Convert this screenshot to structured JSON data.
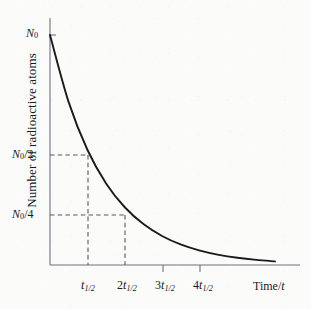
{
  "chart_data": {
    "type": "line",
    "title": "",
    "subtitle": "",
    "xlabel": "Time/t",
    "ylabel": "Number of radioactive atoms",
    "curve_label": "radioactive decay curve",
    "function": "N = N0 * 2^(-t / t_half)",
    "x": [
      0,
      0.5,
      1,
      1.5,
      2,
      2.5,
      3,
      3.5,
      4,
      4.5,
      5,
      5.5,
      6
    ],
    "y": [
      1,
      0.7071,
      0.5,
      0.3536,
      0.25,
      0.1768,
      0.125,
      0.0884,
      0.0625,
      0.0442,
      0.03125,
      0.0221,
      0.0156
    ],
    "x_unit": "half-lives",
    "y_unit": "fraction of N0",
    "xlim": [
      0,
      6
    ],
    "ylim": [
      0,
      1
    ],
    "grid": false,
    "legend": false,
    "x_ticks": [
      {
        "value": 1,
        "label_main": "t",
        "label_sub": "1/2",
        "prefix": ""
      },
      {
        "value": 2,
        "label_main": "t",
        "label_sub": "1/2",
        "prefix": "2"
      },
      {
        "value": 3,
        "label_main": "t",
        "label_sub": "1/2",
        "prefix": "3"
      },
      {
        "value": 4,
        "label_main": "t",
        "label_sub": "1/2",
        "prefix": "4"
      }
    ],
    "y_ticks": [
      {
        "value": 1,
        "label_main": "N",
        "label_sub": "0",
        "suffix": ""
      },
      {
        "value": 0.5,
        "label_main": "N",
        "label_sub": "0",
        "suffix": "/2"
      },
      {
        "value": 0.25,
        "label_main": "N",
        "label_sub": "0",
        "suffix": "/4"
      }
    ],
    "annotations": [
      {
        "name": "half-life-1-guide",
        "type": "dashed-guide",
        "from_y": 0.5,
        "to_x": 1
      },
      {
        "name": "half-life-2-guide",
        "type": "dashed-guide",
        "from_y": 0.25,
        "to_x": 2
      }
    ]
  },
  "axes": {
    "y_title": "Number of radioactive atoms",
    "x_title_prefix": "Time/",
    "x_title_var": "t"
  },
  "labels": {
    "n0": "N",
    "n0_sub": "0",
    "n0_half": "N",
    "n0_half_sub": "0",
    "n0_half_suffix": "/2",
    "n0_quarter": "N",
    "n0_quarter_sub": "0",
    "n0_quarter_suffix": "/4",
    "t_half_1_prefix": "",
    "t_half_1_var": "t",
    "t_half_1_sub": "1/2",
    "t_half_2_prefix": "2",
    "t_half_2_var": "t",
    "t_half_2_sub": "1/2",
    "t_half_3_prefix": "3",
    "t_half_3_var": "t",
    "t_half_3_sub": "1/2",
    "t_half_4_prefix": "4",
    "t_half_4_var": "t",
    "t_half_4_sub": "1/2"
  },
  "colors": {
    "background": "#fbfbfa",
    "curve": "#1b1b1e",
    "axis": "#6f7279",
    "dashed": "#58585c",
    "text": "#1a1a1d"
  }
}
